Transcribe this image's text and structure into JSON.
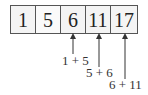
{
  "array": {
    "cells": [
      "1",
      "5",
      "6",
      "11",
      "17"
    ]
  },
  "annotations": [
    {
      "target_index": 2,
      "label": "1 + 5"
    },
    {
      "target_index": 3,
      "label": "5 + 6"
    },
    {
      "target_index": 4,
      "label": "6 + 11"
    }
  ]
}
